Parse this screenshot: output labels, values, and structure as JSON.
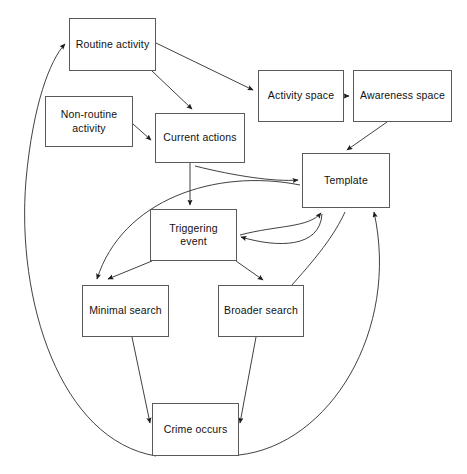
{
  "diagram": {
    "canvas": {
      "width": 467,
      "height": 474
    },
    "style": {
      "background": "#ffffff",
      "box_stroke": "#5a5a5a",
      "edge_stroke": "#2b2b2b",
      "text_color": "#111111"
    },
    "nodes": [
      {
        "id": "routine_activity",
        "label": "Routine activity",
        "x": 69,
        "y": 18,
        "w": 87,
        "h": 53
      },
      {
        "id": "non_routine",
        "label": "Non-routine\nactivity",
        "x": 45,
        "y": 96,
        "w": 88,
        "h": 51
      },
      {
        "id": "current_actions",
        "label": "Current actions",
        "x": 155,
        "y": 113,
        "w": 90,
        "h": 50
      },
      {
        "id": "activity_space",
        "label": "Activity space",
        "x": 258,
        "y": 70,
        "w": 86,
        "h": 52
      },
      {
        "id": "awareness_space",
        "label": "Awareness space",
        "x": 353,
        "y": 70,
        "w": 99,
        "h": 52
      },
      {
        "id": "template",
        "label": "Template",
        "x": 302,
        "y": 153,
        "w": 88,
        "h": 55
      },
      {
        "id": "triggering_event",
        "label": "Triggering event",
        "x": 150,
        "y": 209,
        "w": 87,
        "h": 52
      },
      {
        "id": "minimal_search",
        "label": "Minimal search",
        "x": 82,
        "y": 285,
        "w": 87,
        "h": 52
      },
      {
        "id": "broader_search",
        "label": "Broader search",
        "x": 218,
        "y": 285,
        "w": 86,
        "h": 52
      },
      {
        "id": "crime_occurs",
        "label": "Crime occurs",
        "x": 152,
        "y": 403,
        "w": 87,
        "h": 53
      }
    ],
    "edges": [
      {
        "id": "e1",
        "from": "routine_activity",
        "to": "current_actions",
        "shape": "straight",
        "d": "M 152 71 L 192 109",
        "arrow": true
      },
      {
        "id": "e2",
        "from": "routine_activity",
        "to": "activity_space",
        "shape": "straight",
        "d": "M 156 43 L 253 90",
        "arrow": true
      },
      {
        "id": "e3",
        "from": "non_routine",
        "to": "current_actions",
        "shape": "straight",
        "d": "M 133 124 L 151 140",
        "arrow": true
      },
      {
        "id": "e4",
        "from": "activity_space",
        "to": "awareness_space",
        "shape": "straight",
        "d": "M 344 96 L 349 96",
        "arrow": true
      },
      {
        "id": "e5",
        "from": "awareness_space",
        "to": "template",
        "shape": "straight",
        "d": "M 387 122 L 347 150",
        "arrow": true
      },
      {
        "id": "e6",
        "from": "current_actions",
        "to": "triggering_event",
        "shape": "straight",
        "d": "M 190 163 L 190 205",
        "arrow": true
      },
      {
        "id": "e7",
        "from": "current_actions",
        "to": "template",
        "shape": "curve",
        "d": "M 195 166 C 235 176, 275 182, 298 180",
        "arrow": true
      },
      {
        "id": "e8",
        "from": "template",
        "to": "minimal_search",
        "shape": "curve",
        "d": "M 300 185 C 215 168, 122 200, 97 279",
        "arrow": true
      },
      {
        "id": "e9",
        "from": "triggering_event",
        "to": "minimal_search",
        "shape": "straight",
        "d": "M 152 261 L 108 279",
        "arrow": true
      },
      {
        "id": "e10",
        "from": "triggering_event",
        "to": "broader_search",
        "shape": "straight",
        "d": "M 236 261 L 263 280",
        "arrow": true
      },
      {
        "id": "e11",
        "from": "broader_search",
        "to": "template",
        "shape": "curve",
        "d": "M 240 235 C 278 225, 308 228, 321 213",
        "arrow": true
      },
      {
        "id": "e12",
        "from": "template",
        "to": "triggering_event",
        "shape": "curve",
        "d": "M 322 214 C 320 248, 278 248, 241 237",
        "arrow": true
      },
      {
        "id": "e13",
        "from": "template",
        "to": "broader_search",
        "shape": "curve",
        "d": "M 345 212 C 330 245, 300 275, 286 292",
        "arrow": true
      },
      {
        "id": "e14",
        "from": "minimal_search",
        "to": "crime_occurs",
        "shape": "straight",
        "d": "M 132 337 L 150 423",
        "arrow": true
      },
      {
        "id": "e15",
        "from": "broader_search",
        "to": "crime_occurs",
        "shape": "straight",
        "d": "M 256 337 L 240 423",
        "arrow": true
      },
      {
        "id": "e16",
        "from": "crime_occurs",
        "to": "routine_activity",
        "shape": "curve",
        "d": "M 156 456 C 60 440, 16 300, 26 180 C 33 104, 50 60, 65 44",
        "arrow": true
      },
      {
        "id": "e17",
        "from": "crime_occurs",
        "to": "template",
        "shape": "curve",
        "d": "M 239 455 C 330 445, 400 330, 374 212",
        "arrow": true
      }
    ]
  }
}
